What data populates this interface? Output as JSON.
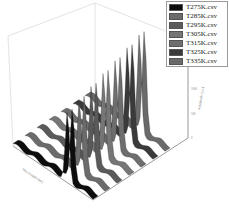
{
  "chart_data": {
    "type": "waterfall-3d",
    "title": "",
    "xlabel": "Wavelength (nm)",
    "ylabel": "Wavelength (nm)",
    "zlabel": "Amplitude (a.u.)",
    "z_ticks": [
      "0",
      "500",
      "1000",
      "1500",
      "2000"
    ],
    "x_ticks": [
      "1000",
      "1200",
      "1400",
      "1600",
      "1800"
    ],
    "legend": {
      "position": "top-right",
      "entries": [
        {
          "label": "T275K.csv",
          "color": "#0d0d0d"
        },
        {
          "label": "T285K.csv",
          "color": "#6b6b6b"
        },
        {
          "label": "T295K.csv",
          "color": "#5a5a5a"
        },
        {
          "label": "T305K.csv",
          "color": "#767676"
        },
        {
          "label": "T315K.csv",
          "color": "#6e6e6e"
        },
        {
          "label": "T325K.csv",
          "color": "#3a3a3a"
        },
        {
          "label": "T335K.csv",
          "color": "#6a6a6a"
        }
      ]
    },
    "series": [
      {
        "name": "T275K.csv",
        "peak_height": 1350,
        "baseline": 80
      },
      {
        "name": "T285K.csv",
        "peak_height": 1450,
        "baseline": 80
      },
      {
        "name": "T295K.csv",
        "peak_height": 1550,
        "baseline": 80
      },
      {
        "name": "T305K.csv",
        "peak_height": 1650,
        "baseline": 80
      },
      {
        "name": "T315K.csv",
        "peak_height": 1750,
        "baseline": 80
      },
      {
        "name": "T325K.csv",
        "peak_height": 1850,
        "baseline": 80
      },
      {
        "name": "T335K.csv",
        "peak_height": 1950,
        "baseline": 80
      }
    ],
    "grid": false
  }
}
